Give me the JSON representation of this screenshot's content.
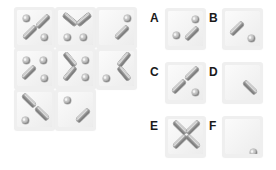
{
  "puzzle": {
    "type": "visual-pattern-matrix",
    "colors": {
      "background": "#ffffff",
      "tile_face": "#f3f3f3",
      "tile_border": "#efefef",
      "bar_dark": "#6f6f6f",
      "bar_light": "#d8d8d8",
      "dot_mid": "#bdbdbd",
      "label_text": "#1a1a1a"
    },
    "grid": {
      "name": "matrix-grid",
      "rows": 3,
      "cols": 3,
      "origin": {
        "x": 14,
        "y": 7
      },
      "tile_size": 41,
      "gap": 0,
      "cells": [
        {
          "id": "cell-r1c1",
          "row": 1,
          "col": 1,
          "dots": [
            {
              "x": 6,
              "y": 5
            },
            {
              "x": 24,
              "y": 24
            }
          ],
          "bars": [
            {
              "x": 18,
              "y": 9,
              "rot": -45
            },
            {
              "x": 5,
              "y": 20,
              "rot": -45
            }
          ]
        },
        {
          "id": "cell-r1c2",
          "row": 1,
          "col": 2,
          "dots": [
            {
              "x": 6,
              "y": 24
            },
            {
              "x": 22,
              "y": 24
            }
          ],
          "bars": [
            {
              "x": 4,
              "y": 7,
              "rot": 40
            },
            {
              "x": 18,
              "y": 7,
              "rot": -40
            }
          ]
        },
        {
          "id": "cell-r1c3",
          "row": 1,
          "col": 3,
          "dots": [
            {
              "x": 25,
              "y": 5
            }
          ],
          "bars": [
            {
              "x": 15,
              "y": 20,
              "rot": -45
            }
          ]
        },
        {
          "id": "cell-r2c1",
          "row": 2,
          "col": 1,
          "dots": [
            {
              "x": 6,
              "y": 6
            },
            {
              "x": 23,
              "y": 6
            },
            {
              "x": 24,
              "y": 24
            }
          ],
          "bars": [
            {
              "x": 4,
              "y": 19,
              "rot": -45
            }
          ]
        },
        {
          "id": "cell-r2c2",
          "row": 2,
          "col": 2,
          "dots": [
            {
              "x": 24,
              "y": 6
            },
            {
              "x": 24,
              "y": 23
            }
          ],
          "bars": [
            {
              "x": 4,
              "y": 6,
              "rot": 50
            },
            {
              "x": 4,
              "y": 20,
              "rot": -50
            }
          ]
        },
        {
          "id": "cell-r2c3",
          "row": 2,
          "col": 3,
          "dots": [
            {
              "x": 4,
              "y": 24
            }
          ],
          "bars": [
            {
              "x": 17,
              "y": 6,
              "rot": -50
            },
            {
              "x": 17,
              "y": 20,
              "rot": 50
            }
          ]
        },
        {
          "id": "cell-r3c1",
          "row": 3,
          "col": 1,
          "dots": [
            {
              "x": 5,
              "y": 25
            }
          ],
          "bars": [
            {
              "x": 4,
              "y": 6,
              "rot": 45
            },
            {
              "x": 17,
              "y": 19,
              "rot": 45
            }
          ]
        },
        {
          "id": "cell-r3c2",
          "row": 3,
          "col": 2,
          "dots": [
            {
              "x": 6,
              "y": 5
            }
          ],
          "bars": [
            {
              "x": 17,
              "y": 21,
              "rot": -45
            }
          ]
        },
        {
          "id": "cell-r3c3",
          "row": 3,
          "col": 3,
          "empty": true,
          "dots": [],
          "bars": []
        }
      ]
    },
    "options": {
      "name": "answer-options",
      "items": [
        {
          "label": "A",
          "label_pos": {
            "x": 150,
            "y": 12
          },
          "tile_pos": {
            "x": 165,
            "y": 8
          },
          "dots": [
            {
              "x": 24,
              "y": 5
            },
            {
              "x": 5,
              "y": 21
            }
          ],
          "bars": [
            {
              "x": 16,
              "y": 20,
              "rot": -45
            }
          ]
        },
        {
          "label": "B",
          "label_pos": {
            "x": 209,
            "y": 12
          },
          "tile_pos": {
            "x": 222,
            "y": 8
          },
          "dots": [
            {
              "x": 23,
              "y": 24
            }
          ],
          "bars": [
            {
              "x": 4,
              "y": 15,
              "rot": -45
            }
          ]
        },
        {
          "label": "C",
          "label_pos": {
            "x": 150,
            "y": 66
          },
          "tile_pos": {
            "x": 165,
            "y": 62
          },
          "dots": [
            {
              "x": 24,
              "y": 24
            }
          ],
          "bars": [
            {
              "x": 16,
              "y": 6,
              "rot": -45
            },
            {
              "x": 3,
              "y": 19,
              "rot": -45
            }
          ]
        },
        {
          "label": "D",
          "label_pos": {
            "x": 209,
            "y": 66
          },
          "tile_pos": {
            "x": 222,
            "y": 62
          },
          "dots": [],
          "bars": [
            {
              "x": 17,
              "y": 20,
              "rot": 45
            }
          ]
        },
        {
          "label": "E",
          "label_pos": {
            "x": 150,
            "y": 120
          },
          "tile_pos": {
            "x": 165,
            "y": 116
          },
          "dots": [],
          "bars": [
            {
              "x": 4,
              "y": 6,
              "rot": 45
            },
            {
              "x": 17,
              "y": 6,
              "rot": -45
            },
            {
              "x": 4,
              "y": 20,
              "rot": -45
            },
            {
              "x": 17,
              "y": 20,
              "rot": 45
            }
          ]
        },
        {
          "label": "F",
          "label_pos": {
            "x": 209,
            "y": 120
          },
          "tile_pos": {
            "x": 222,
            "y": 116
          },
          "dots": [
            {
              "x": 25,
              "y": 30
            }
          ],
          "bars": []
        }
      ]
    }
  }
}
